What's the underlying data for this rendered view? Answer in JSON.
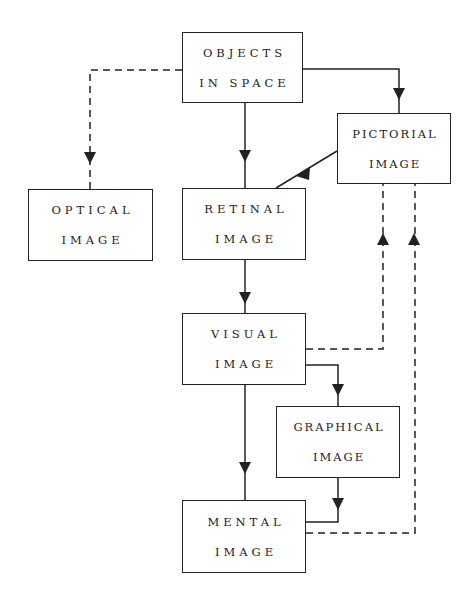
{
  "diagram": {
    "nodes": {
      "objects": {
        "line1": "OBJECTS",
        "line2": "IN SPACE"
      },
      "pictorial": {
        "line1": "PICTORIAL",
        "line2": "IMAGE"
      },
      "optical": {
        "line1": "OPTICAL",
        "line2": "IMAGE"
      },
      "retinal": {
        "line1": "RETINAL",
        "line2": "IMAGE"
      },
      "visual": {
        "line1": "VISUAL",
        "line2": "IMAGE"
      },
      "graphical": {
        "line1": "GRAPHICAL",
        "line2": "IMAGE"
      },
      "mental": {
        "line1": "MENTAL",
        "line2": "IMAGE"
      }
    },
    "edges": [
      {
        "from": "objects",
        "to": "optical",
        "style": "dashed"
      },
      {
        "from": "objects",
        "to": "retinal",
        "style": "solid"
      },
      {
        "from": "objects",
        "to": "pictorial",
        "style": "solid"
      },
      {
        "from": "pictorial",
        "to": "retinal",
        "style": "solid"
      },
      {
        "from": "retinal",
        "to": "visual",
        "style": "solid"
      },
      {
        "from": "visual",
        "to": "pictorial",
        "style": "dashed"
      },
      {
        "from": "visual",
        "to": "graphical",
        "style": "solid"
      },
      {
        "from": "visual",
        "to": "mental",
        "style": "solid"
      },
      {
        "from": "graphical",
        "to": "mental",
        "style": "solid"
      },
      {
        "from": "mental",
        "to": "pictorial",
        "style": "dashed"
      }
    ],
    "colors": {
      "line": "#222222",
      "background": "#ffffff"
    }
  }
}
